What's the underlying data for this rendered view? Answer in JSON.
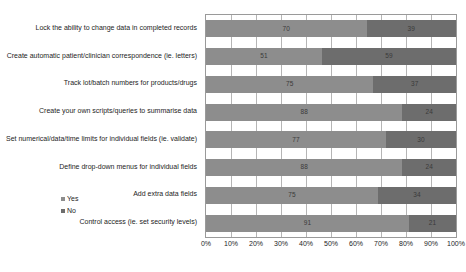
{
  "chart_data": {
    "type": "bar",
    "orientation": "horizontal",
    "stacked": true,
    "normalized_percent": true,
    "title": "",
    "subtitle": "",
    "xlabel": "",
    "ylabel": "",
    "xlim": [
      0,
      100
    ],
    "grid": true,
    "legend_position": "left-inside",
    "xtick_labels": [
      "0%",
      "10%",
      "20%",
      "30%",
      "40%",
      "50%",
      "60%",
      "70%",
      "80%",
      "90%",
      "100%"
    ],
    "xticks": [
      0,
      10,
      20,
      30,
      40,
      50,
      60,
      70,
      80,
      90,
      100
    ],
    "categories": [
      "Lock the ability to change data in completed records",
      "Create automatic patient/clinician correspondence (ie. letters)",
      "Track lot/batch numbers for products/drugs",
      "Create your own scripts/queries to summarise data",
      "Set numerical/data/time limits for individual fields (ie. validate)",
      "Define drop-down menus for individual fields",
      "Add extra data fields",
      "Control access (ie. set security levels)"
    ],
    "series": [
      {
        "name": "Yes",
        "color": "#8d8d8d",
        "values": [
          70,
          51,
          75,
          88,
          77,
          88,
          75,
          91
        ]
      },
      {
        "name": "No",
        "color": "#6d6d6d",
        "values": [
          39,
          59,
          37,
          24,
          30,
          24,
          34,
          21
        ]
      }
    ],
    "legend": [
      {
        "label": "Yes",
        "color": "#8d8d8d"
      },
      {
        "label": "No",
        "color": "#6d6d6d"
      }
    ]
  }
}
